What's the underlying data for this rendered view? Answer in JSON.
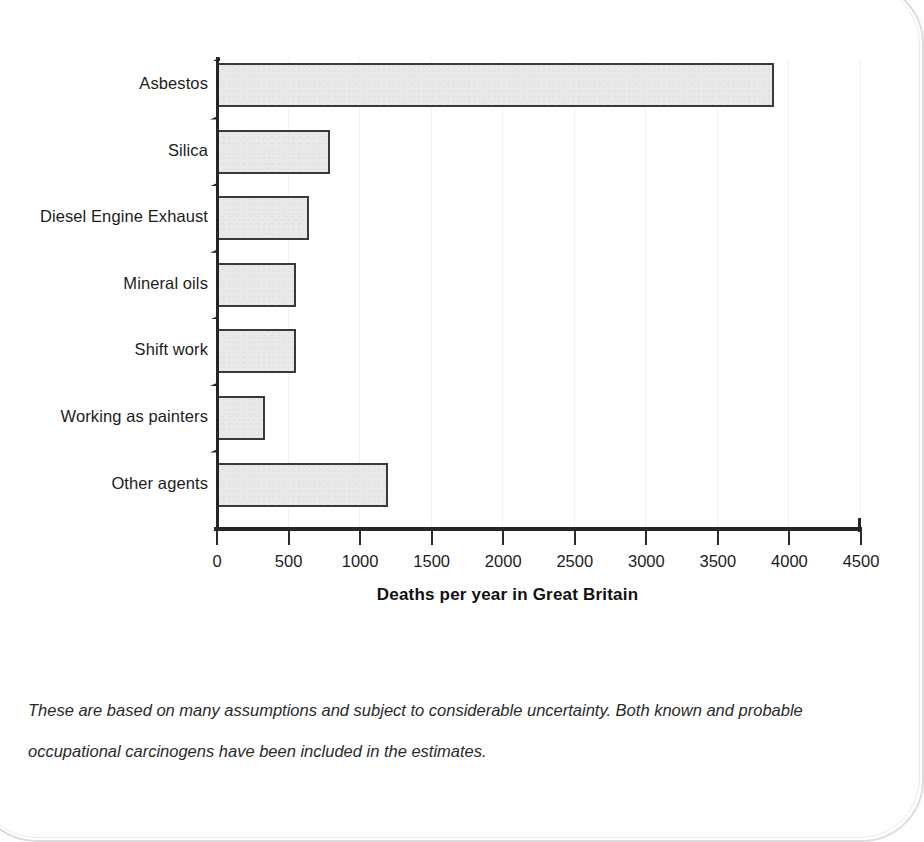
{
  "chart_data": {
    "type": "bar",
    "orientation": "horizontal",
    "title": "",
    "subtitle": "",
    "xlabel": "Deaths per year in Great Britain",
    "ylabel": "",
    "categories": [
      "Asbestos",
      "Silica",
      "Diesel Engine Exhaust",
      "Mineral oils",
      "Shift work",
      "Working as painters",
      "Other agents"
    ],
    "values": [
      3900,
      800,
      650,
      560,
      560,
      340,
      1200
    ],
    "xlim": [
      0,
      4500
    ],
    "xticks": [
      0,
      500,
      1000,
      1500,
      2000,
      2500,
      3000,
      3500,
      4000,
      4500
    ],
    "xtick_labels": [
      "0",
      "500",
      "1000",
      "1500",
      "2000",
      "2500",
      "3000",
      "3500",
      "4000",
      "4500"
    ],
    "grid": "faint vertical gridlines at x ticks",
    "legend": "none",
    "bar_fill": "#e9e9e9",
    "bar_edge": "#3a3a3a",
    "axis_color": "#262626"
  },
  "caption": {
    "line1": "These are based on many assumptions and subject to considerable uncertainty. Both known and probable",
    "line2": "occupational carcinogens have been included in the estimates."
  }
}
